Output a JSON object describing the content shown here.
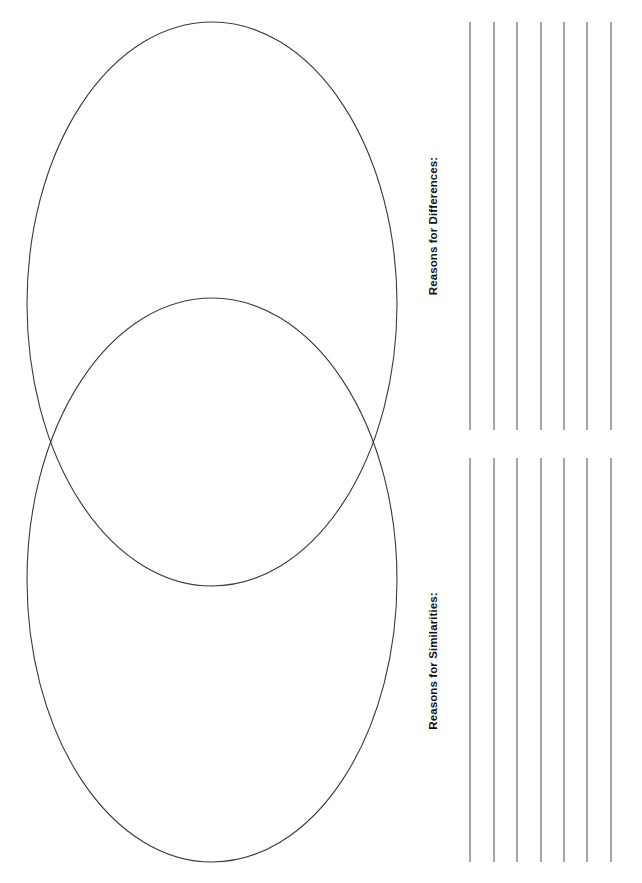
{
  "page": {
    "background_color": "#ffffff",
    "width": 642,
    "height": 883
  },
  "venn": {
    "stroke_color": "#3a3a3a",
    "fill": "none",
    "orientation": "vertical",
    "circle_count": 2,
    "ellipses": [
      {
        "name": "top-ellipse",
        "cx": 212,
        "cy": 304,
        "rx": 185,
        "ry": 282
      },
      {
        "name": "bottom-ellipse",
        "cx": 212,
        "cy": 580,
        "rx": 185,
        "ry": 282
      }
    ],
    "labels": []
  },
  "panels": [
    {
      "id": "differences",
      "label": "Reasons for Differences:",
      "line_count": 7,
      "line_color": "#4a4a4a",
      "line_spacing": 23.5,
      "top": 18,
      "bottom": 434
    },
    {
      "id": "similarities",
      "label": "Reasons for Similarities:",
      "line_count": 7,
      "line_color": "#4a4a4a",
      "line_spacing": 23.5,
      "top": 456,
      "bottom": 866
    }
  ]
}
